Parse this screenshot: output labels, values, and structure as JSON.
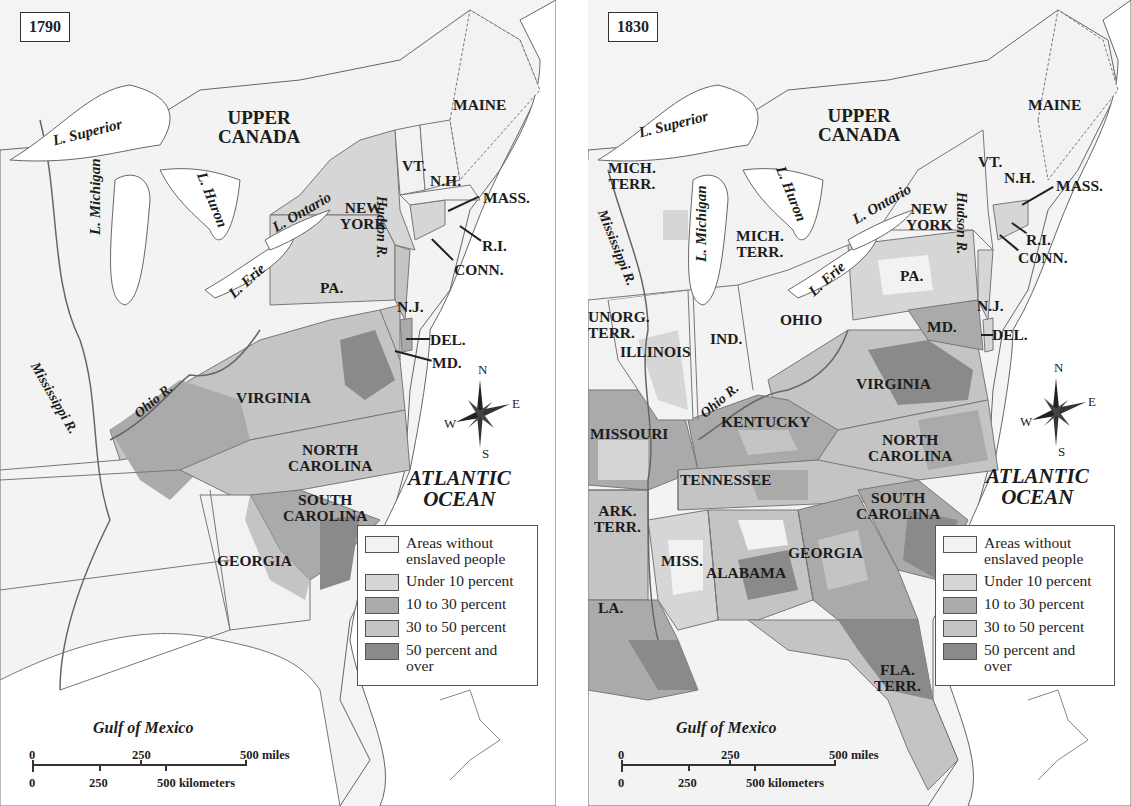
{
  "legend_colors": {
    "none": "#f2f2f2",
    "under_10": "#d6d6d6",
    "10_to_30": "#aaaaaa",
    "30_to_50": "#c4c4c4",
    "50_plus": "#8a8a8a"
  },
  "legend": [
    {
      "key": "none",
      "label_line1": "Areas without",
      "label_line2": "enslaved people"
    },
    {
      "key": "under_10",
      "label_line1": "Under 10 percent",
      "label_line2": ""
    },
    {
      "key": "10_to_30",
      "label_line1": "10 to 30 percent",
      "label_line2": ""
    },
    {
      "key": "30_to_50",
      "label_line1": "30 to 50 percent",
      "label_line2": ""
    },
    {
      "key": "50_plus",
      "label_line1": "50 percent and",
      "label_line2": "over"
    }
  ],
  "scale": {
    "miles": [
      "0",
      "250",
      "500 miles"
    ],
    "km": [
      "0",
      "250",
      "500 kilometers"
    ]
  },
  "compass": {
    "n": "N",
    "e": "E",
    "s": "S",
    "w": "W"
  },
  "maps": [
    {
      "year": "1790",
      "region_labels": {
        "upper_canada_1": "UPPER",
        "upper_canada_2": "CANADA",
        "maine": "MAINE",
        "vt": "VT.",
        "nh": "N.H.",
        "mass": "MASS.",
        "ri": "R.I.",
        "conn": "CONN.",
        "ny1": "NEW",
        "ny2": "YORK",
        "pa": "PA.",
        "nj": "N.J.",
        "del": "DEL.",
        "md": "MD.",
        "virginia": "VIRGINIA",
        "nc1": "NORTH",
        "nc2": "CAROLINA",
        "sc1": "SOUTH",
        "sc2": "CAROLINA",
        "georgia": "GEORGIA"
      },
      "water_labels": {
        "superior": "L. Superior",
        "michigan": "L. Michigan",
        "huron": "L. Huron",
        "ontario": "L. Ontario",
        "erie": "L. Erie",
        "hudson": "Hudson R.",
        "mississippi": "Mississippi R.",
        "ohio": "Ohio R.",
        "atlantic1": "ATLANTIC",
        "atlantic2": "OCEAN",
        "gulf": "Gulf of Mexico"
      }
    },
    {
      "year": "1830",
      "region_labels": {
        "upper_canada_1": "UPPER",
        "upper_canada_2": "CANADA",
        "maine": "MAINE",
        "vt": "VT.",
        "nh": "N.H.",
        "mass": "MASS.",
        "ri": "R.I.",
        "conn": "CONN.",
        "ny1": "NEW",
        "ny2": "YORK",
        "pa": "PA.",
        "nj": "N.J.",
        "del": "DEL.",
        "md": "MD.",
        "mich_terr_w1": "MICH.",
        "mich_terr_w2": "TERR.",
        "mich_terr_1": "MICH.",
        "mich_terr_2": "TERR.",
        "unorg1": "UNORG.",
        "unorg2": "TERR.",
        "illinois": "ILLINOIS",
        "ind": "IND.",
        "ohio": "OHIO",
        "missouri": "MISSOURI",
        "kentucky": "KENTUCKY",
        "virginia": "VIRGINIA",
        "tennessee": "TENNESSEE",
        "nc1": "NORTH",
        "nc2": "CAROLINA",
        "sc1": "SOUTH",
        "sc2": "CAROLINA",
        "ark1": "ARK.",
        "ark2": "TERR.",
        "miss": "MISS.",
        "alabama": "ALABAMA",
        "georgia": "GEORGIA",
        "la": "LA.",
        "fla1": "FLA.",
        "fla2": "TERR."
      },
      "water_labels": {
        "superior": "L. Superior",
        "michigan": "L. Michigan",
        "huron": "L. Huron",
        "ontario": "L. Ontario",
        "erie": "L. Erie",
        "hudson": "Hudson R.",
        "mississippi": "Mississippi R.",
        "ohio": "Ohio R.",
        "atlantic1": "ATLANTIC",
        "atlantic2": "OCEAN",
        "gulf": "Gulf of Mexico"
      }
    }
  ]
}
